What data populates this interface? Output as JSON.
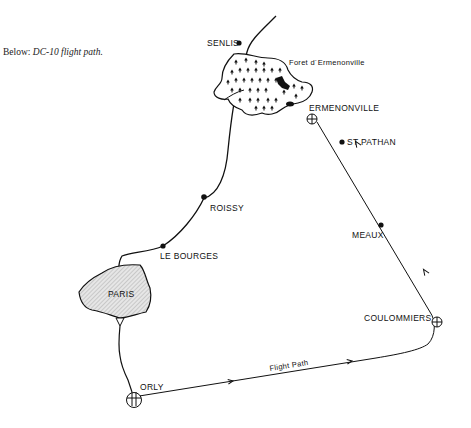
{
  "caption": {
    "prefix": "Below: ",
    "title": "DC-10 flight path."
  },
  "map": {
    "places": {
      "senlis": "SENLIS",
      "forest": "Foret d´Ermenonville",
      "ermenonville": "ERMENONVILLE",
      "st_pathan": "ST PATHAN",
      "meaux": "MEAUX",
      "roissy": "ROISSY",
      "le_bourges": "LE BOURGES",
      "paris": "PARIS",
      "coulommiers": "COULOMMIERS",
      "orly": "ORLY"
    },
    "route_label": "Flight Path",
    "colors": {
      "ink": "#111111",
      "paris_fill": "#dcdcdc"
    }
  }
}
